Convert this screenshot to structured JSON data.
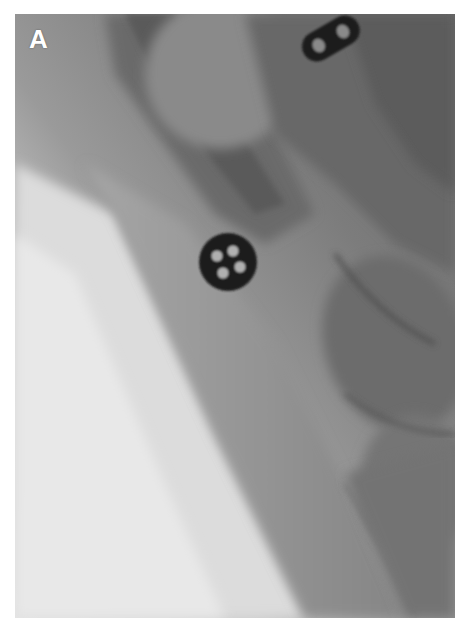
{
  "figure": {
    "panel_label": "A",
    "colors": {
      "background": "#ffffff",
      "soft_tissue_bright": "#d6d6d6",
      "soft_tissue_mid": "#8e8e8e",
      "bone_dark": "#5e5e5e",
      "marker": "#1a1a1a",
      "marker_hole": "#b8b8b8"
    },
    "markers": [
      {
        "name": "round-button-marker",
        "holes": 4
      },
      {
        "name": "oblong-marker",
        "holes": 2
      }
    ]
  }
}
